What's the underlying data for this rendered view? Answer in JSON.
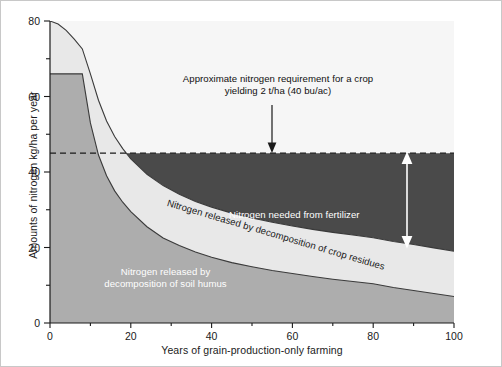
{
  "chart_data": {
    "type": "area",
    "title": "",
    "xlabel": "Years of grain-production-only farming",
    "ylabel": "Amounts of nitrogen kg/ha per year",
    "xlim": [
      0,
      100
    ],
    "ylim": [
      0,
      80
    ],
    "xticks": [
      0,
      20,
      40,
      60,
      80,
      100
    ],
    "xticklabels": [
      "0",
      "20",
      "40",
      "60",
      "80",
      "100"
    ],
    "xminorticks": [
      10,
      30,
      50,
      70,
      90
    ],
    "yticks": [
      0,
      20,
      40,
      60,
      80
    ],
    "yticklabels": [
      "0",
      "20",
      "40",
      "60",
      "80"
    ],
    "yminorticks": [
      10,
      30,
      50,
      70
    ],
    "grid": false,
    "legend": "none",
    "x": [
      0,
      2,
      4,
      6,
      8,
      10,
      12,
      14,
      16,
      18,
      20,
      24,
      28,
      32,
      36,
      40,
      45,
      50,
      55,
      60,
      65,
      70,
      75,
      80,
      85,
      90,
      95,
      100
    ],
    "series": [
      {
        "name": "Nitrogen released by decomposition of soil humus",
        "stacked_order": 1,
        "fill": "#adadad",
        "values": [
          66,
          66,
          66,
          66,
          66,
          53,
          44.5,
          39,
          35,
          32,
          29.5,
          25.5,
          22.5,
          20.5,
          18.8,
          17.4,
          16,
          14.9,
          13.9,
          13.1,
          12.3,
          11.6,
          11,
          10.4,
          9.4,
          8.6,
          7.8,
          7
        ]
      },
      {
        "name": "Nitrogen released by decomposition of crop residues",
        "stacked_order": 2,
        "fill": "#e8e8e8",
        "cumulative_total_values": [
          80,
          79.2,
          77.5,
          75.2,
          72.6,
          66,
          59,
          53.5,
          49.4,
          46.2,
          43.5,
          39.4,
          36.4,
          34.1,
          32.2,
          30.7,
          29.1,
          27.8,
          26.7,
          25.7,
          24.8,
          24,
          23.3,
          22.6,
          21.6,
          20.8,
          19.9,
          19
        ],
        "band_values": [
          14,
          13.2,
          11.5,
          9.2,
          6.6,
          13,
          14.5,
          14.5,
          14.4,
          14.2,
          14,
          13.9,
          13.9,
          13.6,
          13.4,
          13.3,
          13.1,
          12.9,
          12.8,
          12.6,
          12.5,
          12.4,
          12.3,
          12.2,
          12.2,
          12.2,
          12.1,
          12
        ]
      },
      {
        "name": "Nitrogen needed from fertilizer",
        "stacked_order": 3,
        "fill": "#4a4a4a",
        "description": "Region between the total nitrogen released curve and the crop nitrogen requirement line, from the crossover year to year 100"
      }
    ],
    "reference_line": {
      "label": "Approximate nitrogen requirement for a crop yielding 2 t/ha (40 bu/ac)",
      "value": 45,
      "style": "dashed",
      "color": "#1a1a1a",
      "crossover_x": 26
    },
    "annotations": [
      {
        "name": "requirement",
        "text": "Approximate nitrogen requirement for a crop\nyielding 2 t/ha (40 bu/ac)",
        "color": "#101010"
      },
      {
        "name": "fertilizer",
        "text": "Nitrogen needed from fertilizer",
        "color": "#ffffff"
      },
      {
        "name": "residues",
        "text": "Nitrogen released by decomposition of crop residues",
        "color": "#1a1a1a"
      },
      {
        "name": "humus",
        "text": "Nitrogen released by\ndecomposition of soil humus",
        "color": "#ffffff"
      }
    ],
    "arrows": [
      {
        "name": "requirement-pointer",
        "from": [
          55,
          62
        ],
        "to": [
          55,
          46.5
        ],
        "color": "#1a1a1a",
        "heads": "single"
      },
      {
        "name": "fertilizer-span",
        "from": [
          88.5,
          45
        ],
        "to": [
          88.5,
          20
        ],
        "color": "#ffffff",
        "heads": "double"
      }
    ]
  },
  "colors": {
    "humus": "#adadad",
    "residues": "#e8e8e8",
    "fertilizer": "#4a4a4a",
    "above_total": "#f6f6f6",
    "axis": "#1a1a1a",
    "border": "#c8c8c8"
  }
}
